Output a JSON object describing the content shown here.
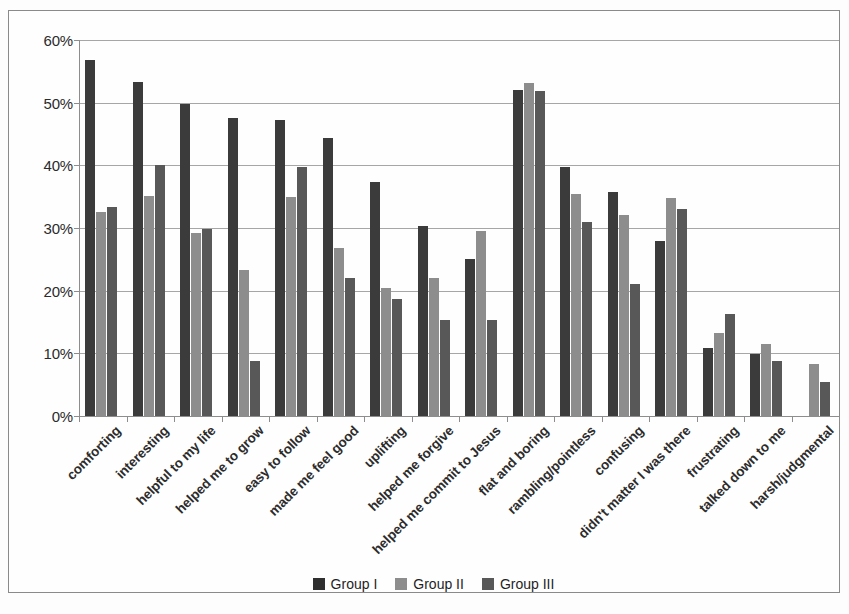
{
  "chart_data": {
    "type": "bar",
    "title": "",
    "subtitle": "",
    "xlabel": "",
    "ylabel": "",
    "ylim": [
      0,
      60
    ],
    "ytick_labels": [
      "0%",
      "10%",
      "20%",
      "30%",
      "40%",
      "50%",
      "60%"
    ],
    "ytick_values": [
      0,
      10,
      20,
      30,
      40,
      50,
      60
    ],
    "grid": true,
    "legend_position": "bottom",
    "categories": [
      "comforting",
      "interesting",
      "helpful to my life",
      "helped me to grow",
      "easy to follow",
      "made me feel good",
      "uplifting",
      "helped me forgive",
      "helped me commit to Jesus",
      "flat and boring",
      "rambling/pointless",
      "confusing",
      "didn't matter I was there",
      "frustrating",
      "talked down to me",
      "harsh/judgmental"
    ],
    "series": [
      {
        "name": "Group I",
        "color": "#3b3b3b",
        "values": [
          56.8,
          53.3,
          49.8,
          47.5,
          47.2,
          44.3,
          37.3,
          30.4,
          25.0,
          52.0,
          39.7,
          35.8,
          28.0,
          10.8,
          9.9,
          0
        ]
      },
      {
        "name": "Group II",
        "color": "#8d8d8d",
        "values": [
          32.6,
          35.1,
          29.2,
          23.3,
          35.0,
          26.8,
          20.4,
          22.1,
          29.6,
          53.2,
          35.4,
          32.1,
          34.8,
          13.3,
          11.5,
          8.3
        ]
      },
      {
        "name": "Group III",
        "color": "#585858",
        "values": [
          33.4,
          40.0,
          29.9,
          8.8,
          39.8,
          22.1,
          18.6,
          15.4,
          15.4,
          51.9,
          30.9,
          21.0,
          33.0,
          16.3,
          8.7,
          5.4
        ]
      }
    ]
  },
  "legend": {
    "items": [
      {
        "label": "Group I",
        "swatch": "legend-swatch-group-1"
      },
      {
        "label": "Group II",
        "swatch": "legend-swatch-group-2"
      },
      {
        "label": "Group III",
        "swatch": "legend-swatch-group-3"
      }
    ]
  }
}
